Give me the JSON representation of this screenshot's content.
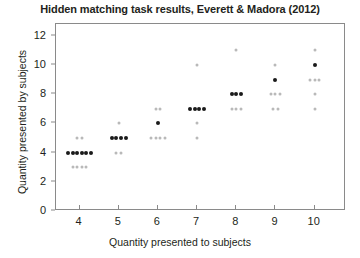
{
  "chart_data": {
    "type": "scatter",
    "title": "Hidden matching task results, Everett & Madora (2012)",
    "xlabel": "Quantity presented to subjects",
    "ylabel": "Quantity presented by subjects",
    "xlim": [
      3.4,
      10.8
    ],
    "ylim": [
      0,
      12.8
    ],
    "xticks": [
      4,
      5,
      6,
      7,
      8,
      9,
      10
    ],
    "yticks": [
      0,
      2,
      4,
      6,
      8,
      10,
      12
    ],
    "grid": false,
    "legend": null,
    "marker_color": "#1a1a1a",
    "faint_marker_color": "#b9b9b9",
    "points": [
      {
        "x": 4,
        "y": 5,
        "count": 2,
        "emphasis": "faint"
      },
      {
        "x": 4,
        "y": 4,
        "count": 6,
        "emphasis": "bold"
      },
      {
        "x": 4,
        "y": 3,
        "count": 4,
        "emphasis": "faint"
      },
      {
        "x": 5,
        "y": 6,
        "count": 1,
        "emphasis": "faint"
      },
      {
        "x": 5,
        "y": 5,
        "count": 4,
        "emphasis": "bold"
      },
      {
        "x": 5,
        "y": 4,
        "count": 2,
        "emphasis": "faint"
      },
      {
        "x": 6,
        "y": 7,
        "count": 2,
        "emphasis": "faint"
      },
      {
        "x": 6,
        "y": 6,
        "count": 1,
        "emphasis": "bold"
      },
      {
        "x": 6,
        "y": 5,
        "count": 4,
        "emphasis": "faint"
      },
      {
        "x": 7,
        "y": 10,
        "count": 1,
        "emphasis": "faint"
      },
      {
        "x": 7,
        "y": 7,
        "count": 4,
        "emphasis": "bold"
      },
      {
        "x": 7,
        "y": 6,
        "count": 1,
        "emphasis": "faint"
      },
      {
        "x": 7,
        "y": 5,
        "count": 1,
        "emphasis": "faint"
      },
      {
        "x": 8,
        "y": 11,
        "count": 1,
        "emphasis": "faint"
      },
      {
        "x": 8,
        "y": 8,
        "count": 3,
        "emphasis": "bold"
      },
      {
        "x": 8,
        "y": 7,
        "count": 3,
        "emphasis": "faint"
      },
      {
        "x": 9,
        "y": 10,
        "count": 1,
        "emphasis": "faint"
      },
      {
        "x": 9,
        "y": 9,
        "count": 1,
        "emphasis": "bold"
      },
      {
        "x": 9,
        "y": 8,
        "count": 3,
        "emphasis": "faint"
      },
      {
        "x": 9,
        "y": 7,
        "count": 2,
        "emphasis": "faint"
      },
      {
        "x": 10,
        "y": 11,
        "count": 1,
        "emphasis": "faint"
      },
      {
        "x": 10,
        "y": 10,
        "count": 1,
        "emphasis": "bold"
      },
      {
        "x": 10,
        "y": 9,
        "count": 3,
        "emphasis": "faint"
      },
      {
        "x": 10,
        "y": 8,
        "count": 1,
        "emphasis": "faint"
      },
      {
        "x": 10,
        "y": 7,
        "count": 1,
        "emphasis": "faint"
      }
    ]
  }
}
